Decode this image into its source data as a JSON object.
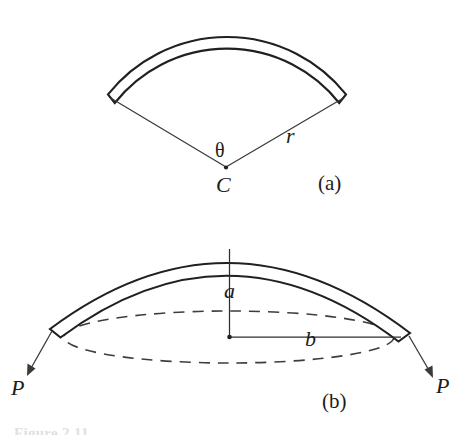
{
  "figure": {
    "background_color": "#ffffff",
    "ink_color": "#20201f",
    "caption_cut_off": "Figure 2.11",
    "panels": [
      {
        "id": "panel-a",
        "caption": "(a)",
        "caption_x": 318,
        "caption_y": 190,
        "description": "Circular arch segment of radius r subtending angle theta at center C",
        "labels": [
          {
            "name": "radius-label",
            "text": "r",
            "x": 286,
            "y": 143,
            "style": "italic"
          },
          {
            "name": "angle-label",
            "text": "θ",
            "x": 215,
            "y": 157,
            "style": "greek"
          },
          {
            "name": "center-label",
            "text": "C",
            "x": 216,
            "y": 192,
            "style": "italic"
          }
        ],
        "geometry": {
          "center_x": 227,
          "center_y": 168,
          "outer_radius": 152,
          "shell_thickness": 9,
          "start_angle_deg": 212,
          "end_angle_deg": 328,
          "left_end_x": 110,
          "left_end_y": 95,
          "right_end_x": 345,
          "right_end_y": 95
        }
      },
      {
        "id": "panel-b",
        "caption": "(b)",
        "caption_x": 322,
        "caption_y": 408,
        "description": "Shallow spherical cap shell of rise a and base radius b loaded by edge forces P",
        "labels": [
          {
            "name": "rise-label",
            "text": "a",
            "x": 224,
            "y": 298,
            "style": "italic"
          },
          {
            "name": "base-radius-label",
            "text": "b",
            "x": 305,
            "y": 346,
            "style": "italic"
          },
          {
            "name": "force-label-left",
            "text": "P",
            "x": 11,
            "y": 395,
            "style": "italic"
          },
          {
            "name": "force-label-right",
            "text": "P",
            "x": 436,
            "y": 393,
            "style": "italic"
          }
        ],
        "geometry": {
          "center_x": 229,
          "center_y": 337,
          "ellipse_rx": 165,
          "ellipse_ry": 26,
          "dome_outer_apex_y": 233,
          "dome_inner_apex_y": 248,
          "shell_thickness": 10,
          "left_tip_x": 51,
          "left_tip_y": 330,
          "right_tip_x": 409,
          "right_tip_y": 334,
          "arrow_left_end_x": 27,
          "arrow_left_end_y": 373,
          "arrow_right_end_x": 433,
          "arrow_right_end_y": 376
        }
      }
    ]
  }
}
